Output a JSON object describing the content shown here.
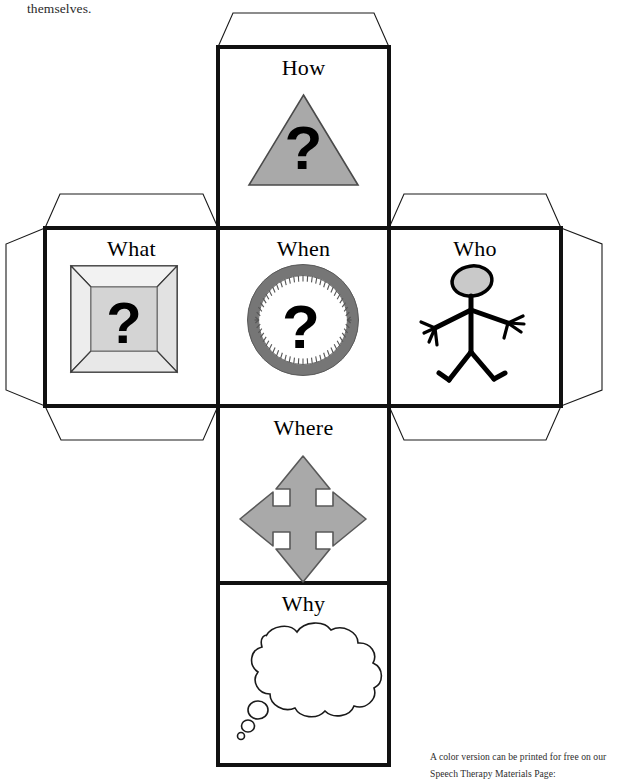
{
  "document": {
    "type": "printable-cube-net",
    "continuation_text": "themselves.",
    "footer_lines": [
      "A color version can be printed for free on our",
      "Speech Therapy Materials Page:"
    ]
  },
  "colors": {
    "ink": "#000000",
    "paper": "#ffffff",
    "cut_line": "#1a1a1a",
    "fold_line": "#3a3a3a",
    "icon_gray": "#a8a8a8",
    "icon_gray_dark": "#7d7d7d",
    "icon_gray_light": "#d8d8d8",
    "clock_rim": "#767676",
    "text_gray": "#2a2a2a"
  },
  "net": {
    "layout": "cross",
    "faces": [
      {
        "id": "how",
        "label": "How",
        "icon": "gray-triangle-question-icon",
        "icon_description": "gray triangle containing a black question mark",
        "row": "top",
        "column": "center"
      },
      {
        "id": "what",
        "label": "What",
        "icon": "beveled-frame-question-icon",
        "icon_description": "beveled picture frame containing a black question mark",
        "row": "middle",
        "column": "left"
      },
      {
        "id": "when",
        "label": "When",
        "icon": "clock-question-icon",
        "icon_description": "round clock with gray rim and a black question mark on the dial",
        "row": "middle",
        "column": "center"
      },
      {
        "id": "who",
        "label": "Who",
        "icon": "stick-figure-icon",
        "icon_description": "stick figure person with a gray oval head",
        "row": "middle",
        "column": "right"
      },
      {
        "id": "where",
        "label": "Where",
        "icon": "four-way-arrow-icon",
        "icon_description": "gray four-directional arrow pointing up, down, left and right",
        "row": "lower",
        "column": "center"
      },
      {
        "id": "why",
        "label": "Why",
        "icon": "thought-bubble-icon",
        "icon_description": "white thought bubble with two small trailing bubbles",
        "row": "bottom",
        "column": "center"
      }
    ],
    "tabs": [
      {
        "id": "tab-top-how",
        "edge": "top",
        "attached_face": "how"
      },
      {
        "id": "tab-top-what",
        "edge": "top",
        "attached_face": "what"
      },
      {
        "id": "tab-left-what",
        "edge": "left",
        "attached_face": "what"
      },
      {
        "id": "tab-bottom-what",
        "edge": "bottom",
        "attached_face": "what"
      },
      {
        "id": "tab-top-who",
        "edge": "top",
        "attached_face": "who"
      },
      {
        "id": "tab-right-who",
        "edge": "right",
        "attached_face": "who"
      },
      {
        "id": "tab-bottom-who",
        "edge": "bottom",
        "attached_face": "who"
      }
    ]
  }
}
